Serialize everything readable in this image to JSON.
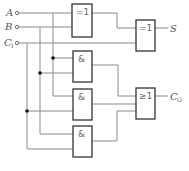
{
  "diagram": {
    "type": "logic-circuit",
    "inputs": [
      {
        "name": "A",
        "sub": ""
      },
      {
        "name": "B",
        "sub": ""
      },
      {
        "name": "C",
        "sub": "I"
      }
    ],
    "outputs": [
      {
        "name": "S",
        "sub": ""
      },
      {
        "name": "C",
        "sub": "O"
      }
    ],
    "gates": [
      {
        "id": "xor1",
        "symbol": "=1",
        "inputs": [
          "A",
          "B"
        ]
      },
      {
        "id": "xor2",
        "symbol": "=1",
        "inputs": [
          "xor1",
          "CI"
        ],
        "output": "S"
      },
      {
        "id": "and1",
        "symbol": "&",
        "inputs": [
          "A",
          "B"
        ]
      },
      {
        "id": "and2",
        "symbol": "&",
        "inputs": [
          "B",
          "CI"
        ]
      },
      {
        "id": "and3",
        "symbol": "&",
        "inputs": [
          "A",
          "CI"
        ]
      },
      {
        "id": "or1",
        "symbol": "≥1",
        "inputs": [
          "and1",
          "and2",
          "and3"
        ],
        "output": "CO"
      }
    ],
    "colors": {
      "wire": "#8a8a8a",
      "gate_border": "#333333",
      "text": "#555555"
    }
  }
}
